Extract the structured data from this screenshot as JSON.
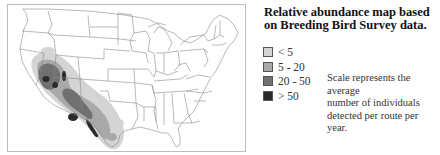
{
  "title": {
    "line1": "Relative abundance map based",
    "line2": "on Breeding Bird Survey data."
  },
  "legend": {
    "items": [
      {
        "label": "< 5",
        "color": "#d4d4d4"
      },
      {
        "label": "5 - 20",
        "color": "#a9a9a9"
      },
      {
        "label": "20 - 50",
        "color": "#707070"
      },
      {
        "label": "> 50",
        "color": "#2a2a2a"
      }
    ]
  },
  "note": {
    "line1": "Scale represents the average",
    "line2": "number of individuals",
    "line3": "detected per route per year."
  },
  "map": {
    "region": "United States",
    "frame_color": "#bdbdbd",
    "state_line_color": "#8a8a8a"
  }
}
